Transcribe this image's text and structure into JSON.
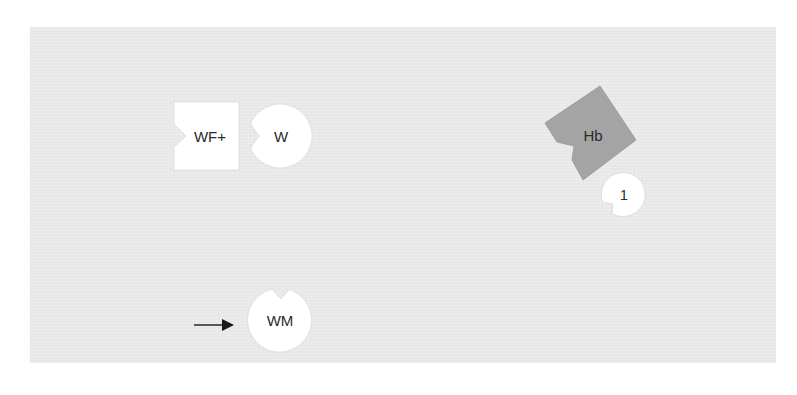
{
  "diagram": {
    "type": "molecular-interaction",
    "background_color": "#e9e9e9",
    "nodes": [
      {
        "id": "wfplus",
        "label": "WF+",
        "shape": "notched-square",
        "fill": "#ffffff",
        "notch_side": "left"
      },
      {
        "id": "w",
        "label": "W",
        "shape": "notched-circle",
        "fill": "#ffffff",
        "notch_side": "left"
      },
      {
        "id": "hb",
        "label": "Hb",
        "shape": "notched-polygon",
        "fill": "#a4a4a4",
        "notch_side": "lower-left"
      },
      {
        "id": "one",
        "label": "1",
        "shape": "notched-circle",
        "fill": "#ffffff",
        "notch_side": "lower-left"
      },
      {
        "id": "wm",
        "label": "WM",
        "shape": "notched-circle",
        "fill": "#ffffff",
        "notch_side": "top"
      }
    ],
    "arrows": [
      {
        "id": "arrow-to-wm",
        "target": "wm",
        "direction": "right",
        "color": "#1a1a1a"
      }
    ]
  }
}
